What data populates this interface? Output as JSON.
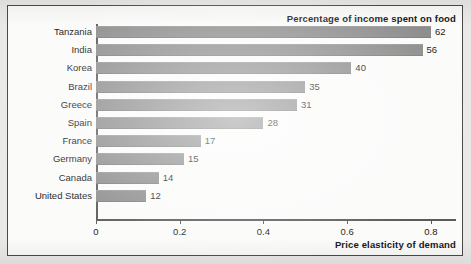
{
  "chart_data": {
    "type": "bar",
    "orientation": "horizontal",
    "title": "Percentage of income spent on food",
    "xlabel": "Price elasticity of demand",
    "ylabel": "",
    "xlim": [
      0,
      0.86
    ],
    "xticks": [
      0,
      0.2,
      0.4,
      0.6,
      0.8
    ],
    "xtick_labels": [
      "0",
      "0.2",
      "0.4",
      "0.6",
      "0.8"
    ],
    "grid": false,
    "legend": "none",
    "bar_color": "#8d8d8d",
    "categories": [
      "Tanzania",
      "India",
      "Korea",
      "Brazil",
      "Greece",
      "Spain",
      "France",
      "Germany",
      "Canada",
      "United States"
    ],
    "values": [
      0.8,
      0.78,
      0.61,
      0.5,
      0.48,
      0.4,
      0.25,
      0.21,
      0.15,
      0.12
    ],
    "data_labels": [
      "62",
      "56",
      "40",
      "35",
      "31",
      "28",
      "17",
      "15",
      "14",
      "12"
    ],
    "data_label_meaning": "Percentage of income spent on food",
    "points": [
      {
        "category": "Tanzania",
        "elasticity": 0.8,
        "percent_income_on_food": 62
      },
      {
        "category": "India",
        "elasticity": 0.78,
        "percent_income_on_food": 56
      },
      {
        "category": "Korea",
        "elasticity": 0.61,
        "percent_income_on_food": 40
      },
      {
        "category": "Brazil",
        "elasticity": 0.5,
        "percent_income_on_food": 35
      },
      {
        "category": "Greece",
        "elasticity": 0.48,
        "percent_income_on_food": 31
      },
      {
        "category": "Spain",
        "elasticity": 0.4,
        "percent_income_on_food": 28
      },
      {
        "category": "France",
        "elasticity": 0.25,
        "percent_income_on_food": 17
      },
      {
        "category": "Germany",
        "elasticity": 0.21,
        "percent_income_on_food": 15
      },
      {
        "category": "Canada",
        "elasticity": 0.15,
        "percent_income_on_food": 14
      },
      {
        "category": "United States",
        "elasticity": 0.12,
        "percent_income_on_food": 12
      }
    ]
  }
}
